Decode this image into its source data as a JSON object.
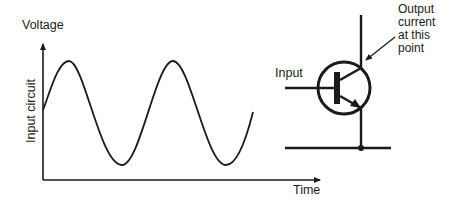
{
  "graph": {
    "y_axis_label": "Voltage",
    "y_axis_rotated_label": "Input circuit",
    "x_axis_label": "Time",
    "waveform": "sine",
    "cycles_shown": 2.2
  },
  "transistor": {
    "input_label": "Input",
    "output_label_lines": [
      "Output",
      "current",
      "at this",
      "point"
    ],
    "type": "npn-bipolar-transistor-icon"
  },
  "colors": {
    "line": "#1a1a1a",
    "background": "#ffffff"
  }
}
